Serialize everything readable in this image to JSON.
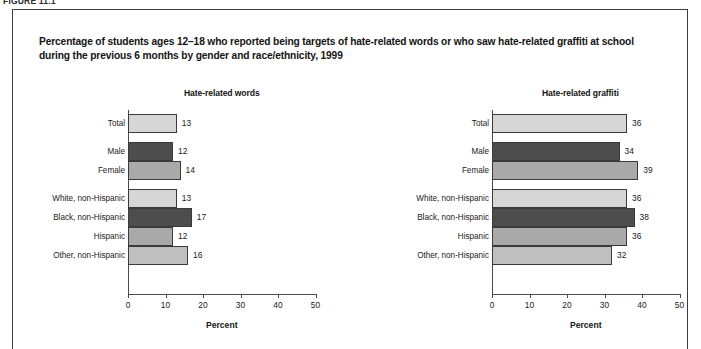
{
  "figure": {
    "number_label": "FIGURE 11.1",
    "title_line_1": "Percentage of students ages 12–18 who reported being targets of hate-related words or who saw hate-related graffiti at school",
    "title_line_2": "during the previous 6 months by gender and race/ethnicity, 1999"
  },
  "axis": {
    "x_title": "Percent",
    "x_ticks": [
      "0",
      "10",
      "20",
      "30",
      "40",
      "50"
    ],
    "x_min": 0,
    "x_max": 50
  },
  "colors": {
    "bar_light": "#d6d6d6",
    "bar_dark": "#4d4d4d",
    "bar_medium": "#a9a9a9",
    "bar_medium_light": "#bfbfbf",
    "bar_outline": "#3a3a3a",
    "axis": "#4a4a4a",
    "border": "#3d3d3d",
    "text": "#1a1a1a"
  },
  "chart_data": [
    {
      "type": "bar",
      "title": "Hate-related words",
      "orientation": "horizontal",
      "xlabel": "Percent",
      "ylabel": "",
      "xlim": [
        0,
        50
      ],
      "grid": false,
      "legend": "none",
      "categories": [
        "Total",
        "Male",
        "Female",
        "White, non-Hispanic",
        "Black, non-Hispanic",
        "Hispanic",
        "Other, non-Hispanic"
      ],
      "values": [
        13,
        12,
        14,
        13,
        17,
        12,
        16
      ],
      "bar_colors": [
        "#d6d6d6",
        "#4d4d4d",
        "#a9a9a9",
        "#d6d6d6",
        "#4d4d4d",
        "#a9a9a9",
        "#bfbfbf"
      ],
      "groups": [
        {
          "name": "Total",
          "categories": [
            "Total"
          ]
        },
        {
          "name": "Gender",
          "categories": [
            "Male",
            "Female"
          ]
        },
        {
          "name": "Race/ethnicity",
          "categories": [
            "White, non-Hispanic",
            "Black, non-Hispanic",
            "Hispanic",
            "Other, non-Hispanic"
          ]
        }
      ]
    },
    {
      "type": "bar",
      "title": "Hate-related graffiti",
      "orientation": "horizontal",
      "xlabel": "Percent",
      "ylabel": "",
      "xlim": [
        0,
        50
      ],
      "grid": false,
      "legend": "none",
      "categories": [
        "Total",
        "Male",
        "Female",
        "White, non-Hispanic",
        "Black, non-Hispanic",
        "Hispanic",
        "Other, non-Hispanic"
      ],
      "values": [
        36,
        34,
        39,
        36,
        38,
        36,
        32
      ],
      "bar_colors": [
        "#d6d6d6",
        "#4d4d4d",
        "#a9a9a9",
        "#d6d6d6",
        "#4d4d4d",
        "#a9a9a9",
        "#bfbfbf"
      ],
      "groups": [
        {
          "name": "Total",
          "categories": [
            "Total"
          ]
        },
        {
          "name": "Gender",
          "categories": [
            "Male",
            "Female"
          ]
        },
        {
          "name": "Race/ethnicity",
          "categories": [
            "White, non-Hispanic",
            "Black, non-Hispanic",
            "Hispanic",
            "Other, non-Hispanic"
          ]
        }
      ]
    }
  ]
}
